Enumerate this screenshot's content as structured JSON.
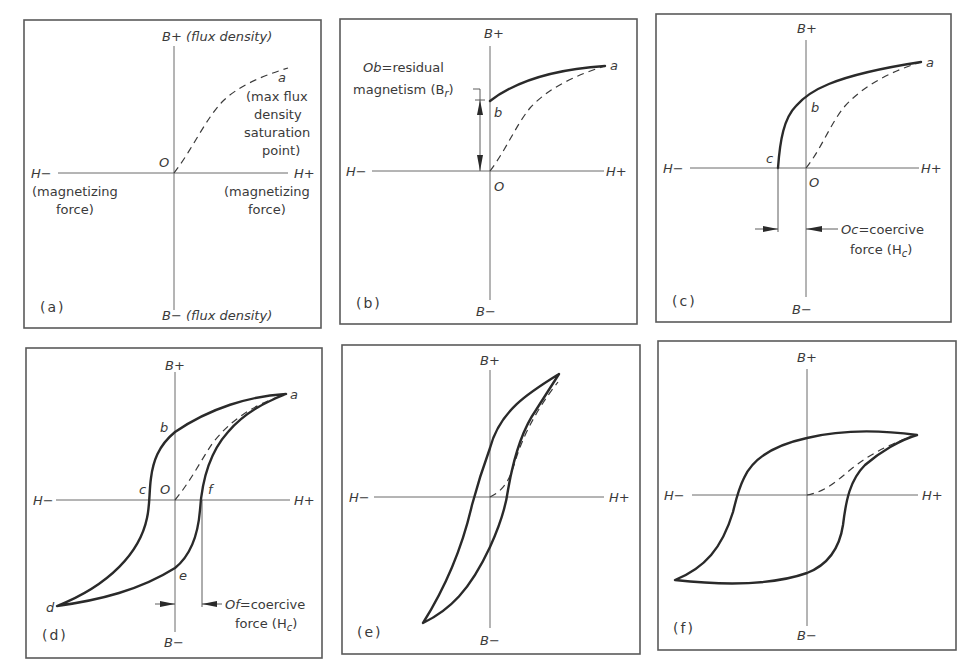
{
  "figure": {
    "panels": [
      {
        "id": "a",
        "label": "(a)",
        "axis_top": "B+ (flux density)",
        "axis_bottom": "B− (flux density)",
        "axis_left": "H−",
        "axis_right": "H+",
        "left_caption_1": "(magnetizing",
        "left_caption_2": "force)",
        "right_caption_1": "(magnetizing",
        "right_caption_2": "force)",
        "origin": "O",
        "point_a": "a",
        "point_a_note": [
          "(max flux",
          "density",
          "saturation",
          "point)"
        ]
      },
      {
        "id": "b",
        "label": "(b)",
        "axis_top": "B+",
        "axis_bottom": "B−",
        "axis_left": "H−",
        "axis_right": "H+",
        "origin": "O",
        "point_a": "a",
        "point_b": "b",
        "annotation_1": "Ob=residual",
        "annotation_2": "magnetism (B",
        "annotation_sub": "r",
        "annotation_close": ")"
      },
      {
        "id": "c",
        "label": "(c)",
        "axis_top": "B+",
        "axis_bottom": "B−",
        "axis_left": "H−",
        "axis_right": "H+",
        "origin": "O",
        "point_a": "a",
        "point_b": "b",
        "point_c": "c",
        "annotation_1": "Oc=coercive",
        "annotation_2": "force (H",
        "annotation_sub": "c",
        "annotation_close": ")"
      },
      {
        "id": "d",
        "label": "(d)",
        "axis_top": "B+",
        "axis_bottom": "B−",
        "axis_left": "H−",
        "axis_right": "H+",
        "origin": "O",
        "point_a": "a",
        "point_b": "b",
        "point_c": "c",
        "point_d": "d",
        "point_e": "e",
        "point_f": "f",
        "annotation_1": "Of=coercive",
        "annotation_2": "force (H",
        "annotation_sub": "c",
        "annotation_close": ")"
      },
      {
        "id": "e",
        "label": "(e)",
        "axis_top": "B+",
        "axis_bottom": "B−",
        "axis_left": "H−",
        "axis_right": "H+"
      },
      {
        "id": "f",
        "label": "(f)",
        "axis_top": "B+",
        "axis_bottom": "B−",
        "axis_left": "H−",
        "axis_right": "H+"
      }
    ]
  },
  "colors": {
    "background": "#ffffff",
    "ink": "#2a2a2a",
    "frame": "#5a5a5a",
    "axis": "#6a6a6a"
  }
}
